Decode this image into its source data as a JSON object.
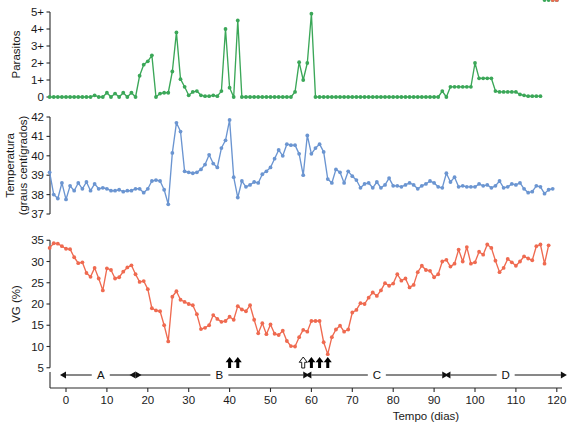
{
  "figure": {
    "title": "",
    "background_color": "#ffffff",
    "panel_count": 3
  },
  "xaxis": {
    "label": "Tempo (dias)",
    "ticks": [
      0,
      10,
      20,
      30,
      40,
      50,
      60,
      70,
      80,
      90,
      100,
      110,
      120
    ],
    "tick_labels": [
      "0",
      "10",
      "20",
      "30",
      "40",
      "50",
      "60",
      "70",
      "80",
      "90",
      "100",
      "110",
      "120"
    ],
    "range": [
      -5,
      122
    ]
  },
  "phases": {
    "items": [
      {
        "label": "A",
        "start": 0,
        "end": 17
      },
      {
        "label": "B",
        "start": 17,
        "end": 58
      },
      {
        "label": "C",
        "start": 60,
        "end": 92
      },
      {
        "label": "D",
        "start": 94,
        "end": 121
      }
    ]
  },
  "treatment_markers": {
    "description": "arrow markers above time axis",
    "solid": [
      40,
      42,
      60,
      62,
      64
    ],
    "hollow": [
      58
    ]
  },
  "chart_data": [
    {
      "type": "line",
      "title": "Parasitos",
      "ylabel": "Parasitos",
      "xlabel": "",
      "color": "#3ba758",
      "ylim": [
        0,
        5
      ],
      "yticks": [
        0,
        1,
        2,
        3,
        4,
        5
      ],
      "ytick_labels": [
        "0",
        "1+",
        "2+",
        "3+",
        "4+",
        "5+"
      ],
      "grid": false,
      "legend": "none",
      "x": [
        -4,
        -3,
        -2,
        -1,
        0,
        1,
        2,
        3,
        4,
        5,
        6,
        7,
        8,
        9,
        10,
        11,
        12,
        13,
        14,
        15,
        16,
        17,
        18,
        19,
        20,
        21,
        22,
        23,
        24,
        25,
        26,
        27,
        28,
        29,
        30,
        31,
        32,
        33,
        34,
        35,
        36,
        37,
        38,
        39,
        40,
        41,
        42,
        43,
        44,
        45,
        46,
        47,
        48,
        49,
        50,
        51,
        52,
        53,
        54,
        55,
        56,
        57,
        58,
        59,
        60,
        61,
        62,
        63,
        64,
        65,
        66,
        67,
        68,
        69,
        70,
        71,
        72,
        73,
        74,
        75,
        76,
        77,
        78,
        79,
        80,
        81,
        82,
        83,
        84,
        85,
        86,
        87,
        88,
        89,
        90,
        91,
        92,
        93,
        94,
        95,
        96,
        97,
        98,
        99,
        100,
        101,
        102,
        103,
        104,
        105,
        106,
        107,
        108,
        109,
        110,
        111,
        112,
        113,
        114,
        115,
        116,
        117,
        118,
        119,
        120
      ],
      "values": [
        0,
        0,
        0,
        0,
        0,
        0,
        0,
        0,
        0,
        0,
        0,
        0.1,
        0,
        0,
        0.25,
        0,
        0.2,
        0,
        0.25,
        0,
        0.25,
        0,
        1.25,
        1.9,
        2.1,
        2.45,
        0,
        0.2,
        0.25,
        0.25,
        1.5,
        3.8,
        1.05,
        0.6,
        0.1,
        0.3,
        0.35,
        0.1,
        0.05,
        0.05,
        0.1,
        0.05,
        0.35,
        4.0,
        0.55,
        0,
        4.5,
        0,
        0,
        0,
        0,
        0,
        0,
        0,
        0,
        0,
        0,
        0,
        0,
        0,
        0.3,
        2.05,
        1.0,
        2.0,
        4.9,
        0,
        0,
        0,
        0,
        0,
        0,
        0,
        0,
        0,
        0,
        0,
        0,
        0,
        0,
        0,
        0,
        0,
        0,
        0,
        0,
        0,
        0,
        0,
        0,
        0,
        0,
        0,
        0,
        0,
        0,
        0,
        0.35,
        0,
        0.6,
        0.6,
        0.6,
        0.6,
        0.6,
        0.6,
        2.0,
        1.1,
        1.1,
        1.1,
        1.1,
        0.35,
        0.3,
        0.3,
        0.3,
        0.3,
        0.3,
        0.15,
        0.1,
        0.05,
        0.05,
        0.05,
        0.05
      ]
    },
    {
      "type": "line",
      "title": "Temperatura",
      "ylabel": "Temperatura (graus centigrados)",
      "ylabel_line1": "Temperatura",
      "ylabel_line2": "(graus centígrados)",
      "xlabel": "",
      "color": "#6b95d1",
      "ylim": [
        37,
        42
      ],
      "yticks": [
        37,
        38,
        39,
        40,
        41,
        42
      ],
      "ytick_labels": [
        "37",
        "38",
        "39",
        "40",
        "41",
        "42"
      ],
      "grid": false,
      "legend": "none",
      "x": [
        -4,
        -3,
        -2,
        -1,
        0,
        1,
        2,
        3,
        4,
        5,
        6,
        7,
        8,
        9,
        10,
        11,
        12,
        13,
        14,
        15,
        16,
        17,
        18,
        19,
        20,
        21,
        22,
        23,
        24,
        25,
        26,
        27,
        28,
        29,
        30,
        31,
        32,
        33,
        34,
        35,
        36,
        37,
        38,
        39,
        40,
        41,
        42,
        43,
        44,
        45,
        46,
        47,
        48,
        49,
        50,
        51,
        52,
        53,
        54,
        55,
        56,
        57,
        58,
        59,
        60,
        61,
        62,
        63,
        64,
        65,
        66,
        67,
        68,
        69,
        70,
        71,
        72,
        73,
        74,
        75,
        76,
        77,
        78,
        79,
        80,
        81,
        82,
        83,
        84,
        85,
        86,
        87,
        88,
        89,
        90,
        91,
        92,
        93,
        94,
        95,
        96,
        97,
        98,
        99,
        100,
        101,
        102,
        103,
        104,
        105,
        106,
        107,
        108,
        109,
        110,
        111,
        112,
        113,
        114,
        115,
        116,
        117,
        118,
        119,
        120
      ],
      "values": [
        39.15,
        38.0,
        37.8,
        38.6,
        37.75,
        38.45,
        38.2,
        38.6,
        38.3,
        38.65,
        38.2,
        38.55,
        38.3,
        38.35,
        38.3,
        38.2,
        38.2,
        38.25,
        38.15,
        38.2,
        38.2,
        38.3,
        38.3,
        38.1,
        38.3,
        38.7,
        38.75,
        38.7,
        38.25,
        37.5,
        40.15,
        41.7,
        41.25,
        39.2,
        39.15,
        39.1,
        39.15,
        39.3,
        39.55,
        40.05,
        39.6,
        39.4,
        40.4,
        40.8,
        41.85,
        38.9,
        37.85,
        38.7,
        38.4,
        38.5,
        38.65,
        38.6,
        39.05,
        39.2,
        39.4,
        39.85,
        40.3,
        40.0,
        40.6,
        40.55,
        40.55,
        40.1,
        39.0,
        41.05,
        40.1,
        40.4,
        40.6,
        40.2,
        38.8,
        38.6,
        39.3,
        39.15,
        38.6,
        39.2,
        38.95,
        38.75,
        38.35,
        38.55,
        38.6,
        38.35,
        38.65,
        38.35,
        38.5,
        38.85,
        38.45,
        38.45,
        38.4,
        38.5,
        38.6,
        38.5,
        38.3,
        38.45,
        38.55,
        38.7,
        38.6,
        38.4,
        38.35,
        39.1,
        38.65,
        38.9,
        38.4,
        38.45,
        38.4,
        38.4,
        38.4,
        38.55,
        38.45,
        38.5,
        38.35,
        38.45,
        38.7,
        38.35,
        38.4,
        38.55,
        38.5,
        38.6,
        38.3,
        38.1,
        38.15,
        38.45,
        38.4,
        38.05,
        38.25,
        38.3
      ]
    },
    {
      "type": "line",
      "title": "VG",
      "ylabel": "VG (%)",
      "xlabel": "Tempo (dias)",
      "color": "#ef6a50",
      "ylim": [
        4,
        36
      ],
      "yticks": [
        5,
        10,
        15,
        20,
        25,
        30,
        35
      ],
      "ytick_labels": [
        "5",
        "10",
        "15",
        "20",
        "25",
        "30",
        "35"
      ],
      "grid": false,
      "legend": "none",
      "x": [
        -4,
        -3,
        -2,
        -1,
        0,
        1,
        2,
        3,
        4,
        5,
        6,
        7,
        8,
        9,
        10,
        11,
        12,
        13,
        14,
        15,
        16,
        17,
        18,
        19,
        20,
        21,
        22,
        23,
        24,
        25,
        26,
        27,
        28,
        29,
        30,
        31,
        32,
        33,
        34,
        35,
        36,
        37,
        38,
        39,
        40,
        41,
        42,
        43,
        44,
        45,
        46,
        47,
        48,
        49,
        50,
        51,
        52,
        53,
        54,
        55,
        56,
        57,
        58,
        59,
        60,
        61,
        62,
        63,
        64,
        65,
        66,
        67,
        68,
        69,
        70,
        71,
        72,
        73,
        74,
        75,
        76,
        77,
        78,
        79,
        80,
        81,
        82,
        83,
        84,
        85,
        86,
        87,
        88,
        89,
        90,
        91,
        92,
        93,
        94,
        95,
        96,
        97,
        98,
        99,
        100,
        101,
        102,
        103,
        104,
        105,
        106,
        107,
        108,
        109,
        110,
        111,
        112,
        113,
        114,
        115,
        116,
        117,
        118,
        119,
        120
      ],
      "values": [
        33.2,
        34.3,
        34.2,
        33.6,
        33.0,
        32.9,
        31.0,
        29.6,
        29.8,
        27.3,
        26.4,
        28.5,
        26.0,
        23.2,
        28.4,
        28.0,
        26.0,
        26.3,
        27.6,
        28.6,
        29.1,
        27.0,
        25.2,
        25.4,
        23.5,
        19.0,
        18.5,
        18.3,
        15.0,
        11.2,
        21.7,
        23.0,
        21.0,
        20.5,
        20.0,
        19.7,
        17.6,
        14.1,
        14.4,
        15.0,
        17.4,
        16.5,
        15.8,
        16.0,
        17.0,
        16.3,
        19.5,
        18.7,
        18.3,
        19.7,
        16.3,
        13.1,
        15.5,
        12.9,
        15.2,
        13.0,
        12.7,
        13.7,
        11.3,
        10.1,
        10.0,
        12.2,
        13.9,
        13.5,
        16.0,
        16.0,
        16.0,
        11.0,
        8.2,
        12.2,
        14.0,
        14.9,
        13.5,
        14.0,
        18.0,
        18.6,
        20.2,
        20.0,
        21.5,
        22.7,
        21.9,
        23.2,
        24.9,
        24.3,
        24.8,
        27.0,
        25.5,
        26.0,
        23.9,
        24.5,
        27.5,
        29.0,
        28.0,
        27.8,
        26.3,
        27.0,
        30.0,
        30.4,
        28.8,
        29.5,
        32.8,
        30.0,
        33.4,
        29.5,
        29.8,
        32.3,
        31.6,
        34.0,
        33.2,
        30.2,
        27.5,
        28.5,
        30.6,
        29.8,
        29.0,
        30.0,
        31.2,
        30.7,
        30.3,
        33.6,
        34.0,
        29.5,
        33.8
      ]
    }
  ]
}
